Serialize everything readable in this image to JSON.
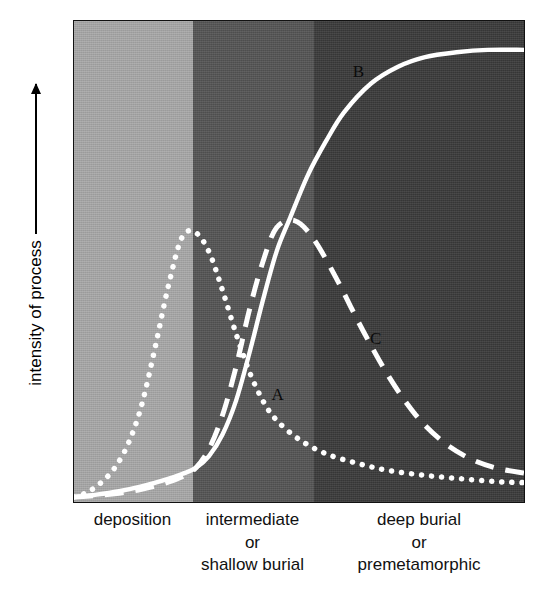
{
  "figure": {
    "type": "line-chart",
    "y_axis": {
      "label": "intensity of process",
      "arrow": "up-arrow-icon"
    },
    "x_axis": {
      "groups": [
        {
          "lines": [
            "deposition"
          ]
        },
        {
          "lines": [
            "intermediate",
            "or",
            "shallow burial"
          ]
        },
        {
          "lines": [
            "deep burial",
            "or",
            "premetamorphic"
          ]
        }
      ]
    },
    "curve_labels": [
      {
        "id": "A",
        "text": "A"
      },
      {
        "id": "B",
        "text": "B"
      },
      {
        "id": "C",
        "text": "C"
      }
    ],
    "colors": {
      "band_deposition": "#a9a9a9",
      "band_intermediate": "#555555",
      "band_deep_burial": "#3b3b3b",
      "curve_stroke": "#ffffff",
      "label_text": "#111111",
      "plot_border": "#111111"
    }
  },
  "chart_data": {
    "type": "line",
    "title": "",
    "xlabel": "",
    "ylabel": "intensity of process",
    "xlim": [
      0,
      100
    ],
    "ylim": [
      0,
      100
    ],
    "grid": false,
    "legend": "inline-curve-labels",
    "x_zones": [
      {
        "name": "deposition",
        "x_start": 0,
        "x_end": 26.3,
        "shade": "#a9a9a9"
      },
      {
        "name": "intermediate or shallow burial",
        "x_start": 26.3,
        "x_end": 53.1,
        "shade": "#555555"
      },
      {
        "name": "deep burial or premetamorphic",
        "x_start": 53.1,
        "x_end": 100,
        "shade": "#3b3b3b"
      }
    ],
    "series": [
      {
        "name": "A",
        "style": "dotted",
        "label_position": {
          "x": 45.0,
          "y": 22.5
        },
        "x": [
          0,
          3,
          6,
          9,
          12,
          15,
          18,
          21,
          24,
          27,
          30,
          33,
          36,
          39,
          42,
          45,
          50,
          56,
          63,
          70,
          78,
          86,
          94,
          100
        ],
        "y": [
          1,
          2,
          4,
          7,
          12,
          20,
          32,
          45,
          55,
          56,
          52,
          44,
          35,
          27,
          21,
          17,
          13,
          10,
          8,
          6.5,
          5.5,
          4.8,
          4.2,
          4
        ]
      },
      {
        "name": "B",
        "style": "solid",
        "label_position": {
          "x": 63.0,
          "y": 89.5
        },
        "x": [
          0,
          5,
          10,
          15,
          20,
          24,
          27,
          30,
          33,
          36,
          39,
          42,
          45,
          48,
          52,
          56,
          60,
          66,
          72,
          78,
          85,
          92,
          100
        ],
        "y": [
          1,
          1.5,
          2.2,
          3.2,
          4.5,
          5.8,
          7,
          9.5,
          14,
          21,
          31,
          42,
          52,
          59,
          68,
          75,
          81,
          87,
          90.5,
          92.5,
          93.5,
          94,
          94
        ]
      },
      {
        "name": "C",
        "style": "dashed",
        "label_position": {
          "x": 66.8,
          "y": 34.2
        },
        "x": [
          0,
          5,
          10,
          15,
          20,
          24,
          27,
          30,
          33,
          36,
          39,
          42,
          45,
          49,
          53,
          58,
          64,
          70,
          76,
          82,
          88,
          94,
          100
        ],
        "y": [
          1,
          1.3,
          1.8,
          2.6,
          3.8,
          5.2,
          7,
          11,
          18,
          28,
          40,
          50,
          57,
          58.5,
          55,
          47,
          36,
          26,
          18,
          12.5,
          9,
          7,
          6
        ]
      }
    ]
  }
}
